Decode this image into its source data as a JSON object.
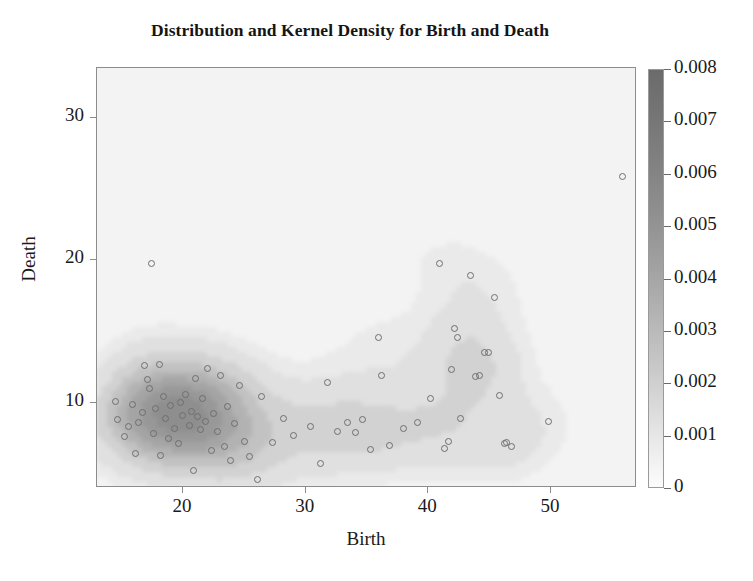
{
  "chart_data": {
    "type": "scatter",
    "title": "Distribution and Kernel Density for Birth and Death",
    "xlabel": "Birth",
    "ylabel": "Death",
    "xlim": [
      13.0,
      57.0
    ],
    "ylim": [
      4.0,
      33.5
    ],
    "xticks": [
      20,
      30,
      40,
      50
    ],
    "xticklabels": [
      "20",
      "30",
      "40",
      "50"
    ],
    "yticks": [
      10,
      20,
      30
    ],
    "yticklabels": [
      "10",
      "20",
      "30"
    ],
    "grid": false,
    "legend": false,
    "overlay": "kernel-density-contourf",
    "colorbar": {
      "label": "",
      "vmin": 0,
      "vmax": 0.008,
      "ticks": [
        0,
        0.001,
        0.002,
        0.003,
        0.004,
        0.005,
        0.006,
        0.007,
        0.008
      ],
      "ticklabels": [
        "0",
        "0.001",
        "0.002",
        "0.003",
        "0.004",
        "0.005",
        "0.006",
        "0.007",
        "0.008"
      ],
      "colormap": "grayscale-reversed",
      "position": "right",
      "low_color": "#fcfcfc",
      "high_color": "#6b6b6b"
    },
    "marker": {
      "shape": "open-circle",
      "size_px": 7,
      "edge_color": "#6e6e6e",
      "face_color": "none"
    },
    "points": [
      {
        "x": 14.5,
        "y": 10.1
      },
      {
        "x": 14.7,
        "y": 8.8
      },
      {
        "x": 15.2,
        "y": 7.6
      },
      {
        "x": 15.6,
        "y": 8.3
      },
      {
        "x": 15.9,
        "y": 9.9
      },
      {
        "x": 16.1,
        "y": 6.4
      },
      {
        "x": 16.4,
        "y": 8.6
      },
      {
        "x": 16.7,
        "y": 9.3
      },
      {
        "x": 16.9,
        "y": 12.6
      },
      {
        "x": 17.1,
        "y": 11.6
      },
      {
        "x": 17.3,
        "y": 11.0
      },
      {
        "x": 17.4,
        "y": 19.8
      },
      {
        "x": 17.6,
        "y": 7.8
      },
      {
        "x": 17.8,
        "y": 9.6
      },
      {
        "x": 18.1,
        "y": 12.7
      },
      {
        "x": 18.2,
        "y": 6.3
      },
      {
        "x": 18.4,
        "y": 10.4
      },
      {
        "x": 18.6,
        "y": 8.9
      },
      {
        "x": 18.8,
        "y": 7.5
      },
      {
        "x": 19.0,
        "y": 9.8
      },
      {
        "x": 19.3,
        "y": 8.2
      },
      {
        "x": 19.6,
        "y": 7.1
      },
      {
        "x": 19.8,
        "y": 10.0
      },
      {
        "x": 20.0,
        "y": 9.1
      },
      {
        "x": 20.2,
        "y": 10.6
      },
      {
        "x": 20.5,
        "y": 8.4
      },
      {
        "x": 20.7,
        "y": 9.4
      },
      {
        "x": 20.9,
        "y": 5.2
      },
      {
        "x": 21.0,
        "y": 11.7
      },
      {
        "x": 21.2,
        "y": 9.0
      },
      {
        "x": 21.4,
        "y": 8.1
      },
      {
        "x": 21.6,
        "y": 10.3
      },
      {
        "x": 21.8,
        "y": 8.7
      },
      {
        "x": 22.0,
        "y": 12.4
      },
      {
        "x": 22.3,
        "y": 6.6
      },
      {
        "x": 22.5,
        "y": 9.2
      },
      {
        "x": 22.8,
        "y": 8.0
      },
      {
        "x": 23.1,
        "y": 11.9
      },
      {
        "x": 23.4,
        "y": 6.9
      },
      {
        "x": 23.6,
        "y": 9.7
      },
      {
        "x": 23.9,
        "y": 5.9
      },
      {
        "x": 24.2,
        "y": 8.5
      },
      {
        "x": 24.6,
        "y": 11.2
      },
      {
        "x": 25.0,
        "y": 7.3
      },
      {
        "x": 25.4,
        "y": 6.2
      },
      {
        "x": 26.1,
        "y": 4.6
      },
      {
        "x": 26.4,
        "y": 10.4
      },
      {
        "x": 27.3,
        "y": 7.2
      },
      {
        "x": 28.2,
        "y": 8.9
      },
      {
        "x": 29.0,
        "y": 7.7
      },
      {
        "x": 30.4,
        "y": 8.3
      },
      {
        "x": 31.2,
        "y": 5.7
      },
      {
        "x": 31.8,
        "y": 11.4
      },
      {
        "x": 32.6,
        "y": 8.0
      },
      {
        "x": 33.4,
        "y": 8.6
      },
      {
        "x": 34.1,
        "y": 7.9
      },
      {
        "x": 34.6,
        "y": 8.8
      },
      {
        "x": 35.3,
        "y": 6.7
      },
      {
        "x": 35.9,
        "y": 14.6
      },
      {
        "x": 36.2,
        "y": 11.9
      },
      {
        "x": 36.8,
        "y": 7.0
      },
      {
        "x": 38.0,
        "y": 8.2
      },
      {
        "x": 39.1,
        "y": 8.6
      },
      {
        "x": 40.2,
        "y": 10.3
      },
      {
        "x": 40.9,
        "y": 19.8
      },
      {
        "x": 41.3,
        "y": 6.8
      },
      {
        "x": 41.6,
        "y": 7.3
      },
      {
        "x": 41.9,
        "y": 12.3
      },
      {
        "x": 42.1,
        "y": 15.2
      },
      {
        "x": 42.4,
        "y": 14.6
      },
      {
        "x": 42.6,
        "y": 8.9
      },
      {
        "x": 43.4,
        "y": 18.9
      },
      {
        "x": 43.8,
        "y": 11.8
      },
      {
        "x": 44.2,
        "y": 11.9
      },
      {
        "x": 44.6,
        "y": 13.5
      },
      {
        "x": 44.9,
        "y": 13.5
      },
      {
        "x": 45.4,
        "y": 17.4
      },
      {
        "x": 45.8,
        "y": 10.5
      },
      {
        "x": 46.2,
        "y": 7.1
      },
      {
        "x": 46.4,
        "y": 7.2
      },
      {
        "x": 46.8,
        "y": 6.9
      },
      {
        "x": 49.8,
        "y": 8.7
      },
      {
        "x": 55.8,
        "y": 25.9
      }
    ],
    "density_bands": [
      {
        "level": 0.0005,
        "fill": "#eaeaea"
      },
      {
        "level": 0.001,
        "fill": "#e0e0e0"
      },
      {
        "level": 0.002,
        "fill": "#d2d2d2"
      },
      {
        "level": 0.003,
        "fill": "#c2c2c2"
      },
      {
        "level": 0.004,
        "fill": "#b2b2b2"
      },
      {
        "level": 0.005,
        "fill": "#a4a4a4"
      },
      {
        "level": 0.006,
        "fill": "#989898"
      },
      {
        "level": 0.007,
        "fill": "#8e8e8e"
      }
    ],
    "density_peak": {
      "x": 20.0,
      "y": 9.3,
      "value": 0.0078
    }
  }
}
